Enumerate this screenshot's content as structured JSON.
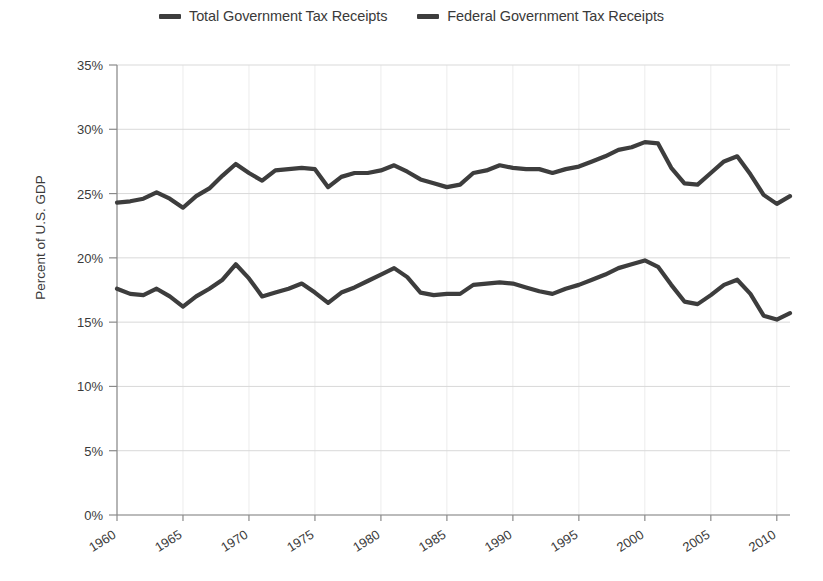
{
  "legend": {
    "position": "top-center",
    "items": [
      {
        "label": "Total Government Tax Receipts",
        "color": "#3d3d3d",
        "icon": "line-swatch-icon"
      },
      {
        "label": "Federal Government Tax Receipts",
        "color": "#3d3d3d",
        "icon": "line-swatch-icon"
      }
    ]
  },
  "axes": {
    "ylabel": "Percent of U.S. GDP",
    "xlabel": "",
    "ytick_labels": [
      "35%",
      "30%",
      "25%",
      "20%",
      "15%",
      "10%",
      "5%",
      "0%"
    ],
    "xtick_labels": [
      "1960",
      "1965",
      "1970",
      "1975",
      "1980",
      "1985",
      "1990",
      "1995",
      "2000",
      "2005",
      "2010"
    ]
  },
  "chart_data": {
    "type": "line",
    "title": "",
    "subtitle": "",
    "xlabel": "",
    "ylabel": "Percent of U.S. GDP",
    "xlim": [
      1960,
      2011
    ],
    "ylim": [
      0,
      35
    ],
    "ytick_values": [
      0,
      5,
      10,
      15,
      20,
      25,
      30,
      35
    ],
    "ytick_labels": [
      "0%",
      "5%",
      "10%",
      "15%",
      "20%",
      "25%",
      "30%",
      "35%"
    ],
    "xtick_values": [
      1960,
      1965,
      1970,
      1975,
      1980,
      1985,
      1990,
      1995,
      2000,
      2005,
      2010
    ],
    "xtick_labels": [
      "1960",
      "1965",
      "1970",
      "1975",
      "1980",
      "1985",
      "1990",
      "1995",
      "2000",
      "2005",
      "2010"
    ],
    "grid": {
      "horizontal": true,
      "vertical": true
    },
    "legend_position": "top-center",
    "units": "percent of GDP",
    "x": [
      1960,
      1961,
      1962,
      1963,
      1964,
      1965,
      1966,
      1967,
      1968,
      1969,
      1970,
      1971,
      1972,
      1973,
      1974,
      1975,
      1976,
      1977,
      1978,
      1979,
      1980,
      1981,
      1982,
      1983,
      1984,
      1985,
      1986,
      1987,
      1988,
      1989,
      1990,
      1991,
      1992,
      1993,
      1994,
      1995,
      1996,
      1997,
      1998,
      1999,
      2000,
      2001,
      2002,
      2003,
      2004,
      2005,
      2006,
      2007,
      2008,
      2009,
      2010,
      2011
    ],
    "series": [
      {
        "name": "Total Government Tax Receipts",
        "color": "#3d3d3d",
        "values": [
          24.3,
          24.4,
          24.6,
          25.1,
          24.6,
          23.9,
          24.8,
          25.4,
          26.4,
          27.3,
          26.6,
          26.0,
          26.8,
          26.9,
          27.0,
          26.9,
          25.5,
          26.3,
          26.6,
          26.6,
          26.8,
          27.2,
          26.7,
          26.1,
          25.8,
          25.5,
          25.7,
          26.6,
          26.8,
          27.2,
          27.0,
          26.9,
          26.9,
          26.6,
          26.9,
          27.1,
          27.5,
          27.9,
          28.4,
          28.6,
          29.0,
          28.9,
          27.0,
          25.8,
          25.7,
          26.6,
          27.5,
          27.9,
          26.5,
          24.9,
          24.2,
          24.8
        ]
      },
      {
        "name": "Federal Government Tax Receipts",
        "color": "#3d3d3d",
        "values": [
          17.6,
          17.2,
          17.1,
          17.6,
          17.0,
          16.2,
          17.0,
          17.6,
          18.3,
          19.5,
          18.4,
          17.0,
          17.3,
          17.6,
          18.0,
          17.3,
          16.5,
          17.3,
          17.7,
          18.2,
          18.7,
          19.2,
          18.5,
          17.3,
          17.1,
          17.2,
          17.2,
          17.9,
          18.0,
          18.1,
          18.0,
          17.7,
          17.4,
          17.2,
          17.6,
          17.9,
          18.3,
          18.7,
          19.2,
          19.5,
          19.8,
          19.3,
          17.9,
          16.6,
          16.4,
          17.1,
          17.9,
          18.3,
          17.2,
          15.5,
          15.2,
          15.7
        ]
      }
    ]
  }
}
